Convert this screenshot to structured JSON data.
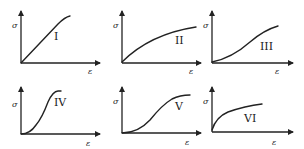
{
  "figure": {
    "y_axis_symbol": "σ",
    "x_axis_symbol": "ε",
    "panels": [
      {
        "id": "I",
        "label": "I",
        "shape": "linear rising, slight plateau at top"
      },
      {
        "id": "II",
        "label": "II",
        "shape": "concave down, saturating"
      },
      {
        "id": "III",
        "label": "III",
        "shape": "slightly sigmoidal, concave up then linear"
      },
      {
        "id": "IV",
        "label": "IV",
        "shape": "steep sigmoid with plateau"
      },
      {
        "id": "V",
        "label": "V",
        "shape": "sigmoid, toe region then saturating"
      },
      {
        "id": "VI",
        "label": "VI",
        "shape": "sharp initial rise then gradual concave-down"
      }
    ]
  },
  "colors": {
    "ink": "#222222",
    "background": "#ffffff"
  }
}
